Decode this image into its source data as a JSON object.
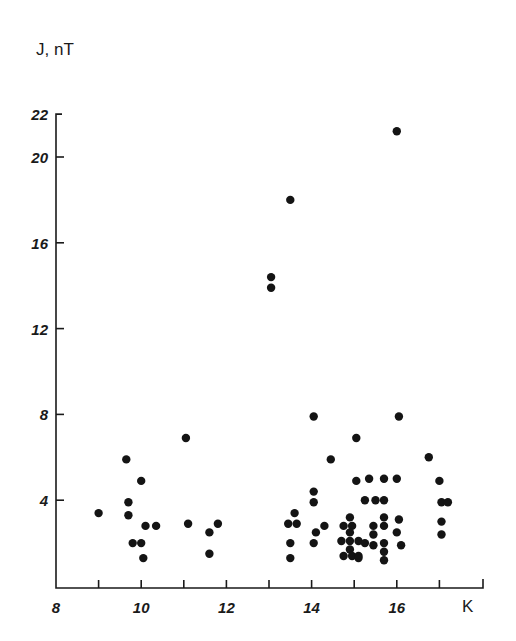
{
  "chart_data": {
    "type": "scatter",
    "title": "",
    "xlabel": "K",
    "ylabel": "J, nT",
    "xlim": [
      8,
      17.8
    ],
    "ylim": [
      0,
      22
    ],
    "x_ticks": [
      8,
      9,
      10,
      11,
      12,
      13,
      14,
      15,
      16,
      17
    ],
    "x_tick_labels": [
      {
        "value": 8,
        "label": "8"
      },
      {
        "value": 10,
        "label": "10"
      },
      {
        "value": 12,
        "label": "12"
      },
      {
        "value": 14,
        "label": "14"
      },
      {
        "value": 16,
        "label": "16"
      }
    ],
    "y_ticks": [
      4,
      8,
      12,
      16,
      20,
      22
    ],
    "y_tick_labels": [
      {
        "value": 4,
        "label": "4"
      },
      {
        "value": 8,
        "label": "8"
      },
      {
        "value": 12,
        "label": "12"
      },
      {
        "value": 16,
        "label": "16"
      },
      {
        "value": 20,
        "label": "20"
      },
      {
        "value": 22,
        "label": "22"
      }
    ],
    "grid": false,
    "legend": null,
    "series": [
      {
        "name": "observations",
        "points": [
          {
            "x": 9.0,
            "y": 3.4
          },
          {
            "x": 9.65,
            "y": 5.9
          },
          {
            "x": 9.7,
            "y": 3.9
          },
          {
            "x": 9.7,
            "y": 3.3
          },
          {
            "x": 9.8,
            "y": 2.0
          },
          {
            "x": 10.0,
            "y": 4.9
          },
          {
            "x": 10.0,
            "y": 2.0
          },
          {
            "x": 10.05,
            "y": 1.3
          },
          {
            "x": 10.1,
            "y": 2.8
          },
          {
            "x": 10.35,
            "y": 2.8
          },
          {
            "x": 11.05,
            "y": 6.9
          },
          {
            "x": 11.1,
            "y": 2.9
          },
          {
            "x": 11.6,
            "y": 2.5
          },
          {
            "x": 11.6,
            "y": 1.5
          },
          {
            "x": 11.8,
            "y": 2.9
          },
          {
            "x": 13.05,
            "y": 14.4
          },
          {
            "x": 13.05,
            "y": 13.9
          },
          {
            "x": 13.5,
            "y": 18.0
          },
          {
            "x": 13.6,
            "y": 3.4
          },
          {
            "x": 13.45,
            "y": 2.9
          },
          {
            "x": 13.65,
            "y": 2.9
          },
          {
            "x": 13.5,
            "y": 2.0
          },
          {
            "x": 13.5,
            "y": 1.3
          },
          {
            "x": 14.05,
            "y": 7.9
          },
          {
            "x": 14.05,
            "y": 4.4
          },
          {
            "x": 14.05,
            "y": 3.9
          },
          {
            "x": 14.1,
            "y": 2.5
          },
          {
            "x": 14.05,
            "y": 2.0
          },
          {
            "x": 14.3,
            "y": 2.8
          },
          {
            "x": 14.45,
            "y": 5.9
          },
          {
            "x": 14.9,
            "y": 3.2
          },
          {
            "x": 14.75,
            "y": 2.8
          },
          {
            "x": 14.95,
            "y": 2.8
          },
          {
            "x": 14.9,
            "y": 2.5
          },
          {
            "x": 14.7,
            "y": 2.1
          },
          {
            "x": 14.9,
            "y": 2.1
          },
          {
            "x": 15.1,
            "y": 2.1
          },
          {
            "x": 14.9,
            "y": 1.7
          },
          {
            "x": 14.75,
            "y": 1.4
          },
          {
            "x": 14.95,
            "y": 1.4
          },
          {
            "x": 15.1,
            "y": 1.4
          },
          {
            "x": 15.05,
            "y": 6.9
          },
          {
            "x": 15.05,
            "y": 4.9
          },
          {
            "x": 15.35,
            "y": 5.0
          },
          {
            "x": 15.7,
            "y": 5.0
          },
          {
            "x": 16.0,
            "y": 5.0
          },
          {
            "x": 15.25,
            "y": 4.0
          },
          {
            "x": 15.5,
            "y": 4.0
          },
          {
            "x": 15.7,
            "y": 4.0
          },
          {
            "x": 15.7,
            "y": 3.2
          },
          {
            "x": 16.05,
            "y": 3.1
          },
          {
            "x": 15.45,
            "y": 2.8
          },
          {
            "x": 15.7,
            "y": 2.8
          },
          {
            "x": 15.45,
            "y": 2.4
          },
          {
            "x": 16.0,
            "y": 2.5
          },
          {
            "x": 15.25,
            "y": 2.0
          },
          {
            "x": 15.45,
            "y": 1.9
          },
          {
            "x": 15.7,
            "y": 2.0
          },
          {
            "x": 16.1,
            "y": 1.9
          },
          {
            "x": 15.7,
            "y": 1.6
          },
          {
            "x": 15.7,
            "y": 1.2
          },
          {
            "x": 15.1,
            "y": 1.3
          },
          {
            "x": 16.0,
            "y": 21.2
          },
          {
            "x": 16.05,
            "y": 7.9
          },
          {
            "x": 16.75,
            "y": 6.0
          },
          {
            "x": 17.0,
            "y": 4.9
          },
          {
            "x": 17.05,
            "y": 3.9
          },
          {
            "x": 17.2,
            "y": 3.9
          },
          {
            "x": 17.05,
            "y": 3.0
          },
          {
            "x": 17.05,
            "y": 2.4
          }
        ]
      }
    ]
  },
  "labels": {
    "y_axis_title": "J, nT",
    "x_axis_title": "K"
  },
  "colors": {
    "ink": "#141414",
    "background": "#ffffff"
  }
}
